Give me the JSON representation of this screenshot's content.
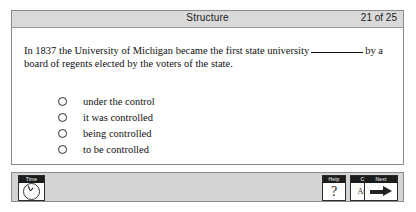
{
  "header": {
    "title": "Structure",
    "counter": "21 of 25"
  },
  "question": {
    "text_before_blank": "In 1837 the University of Michigan became the first state university",
    "blank": "________",
    "text_after_blank": "by a board of regents elected by the voters of the state.",
    "options": [
      {
        "id": "a",
        "label": "under the control",
        "selected": false
      },
      {
        "id": "b",
        "label": "it was controlled",
        "selected": false
      },
      {
        "id": "c",
        "label": "being controlled",
        "selected": false
      },
      {
        "id": "d",
        "label": "to be controlled",
        "selected": false
      }
    ]
  },
  "toolbar": {
    "time": {
      "caption": "Time",
      "icon": "clock-icon"
    },
    "help": {
      "caption": "Help",
      "glyph": "?"
    },
    "confirm": {
      "caption": "Confirm",
      "label": "Answer"
    },
    "next": {
      "caption": "Next",
      "icon": "arrow-right-icon"
    }
  },
  "colors": {
    "page_background": "#ffffff",
    "panel_border": "#8a8a8a",
    "title_bar": "#d9d9d9",
    "toolbar_background": "#d4d4d4",
    "text": "#111111",
    "caption_background": "#1c1c1c"
  }
}
